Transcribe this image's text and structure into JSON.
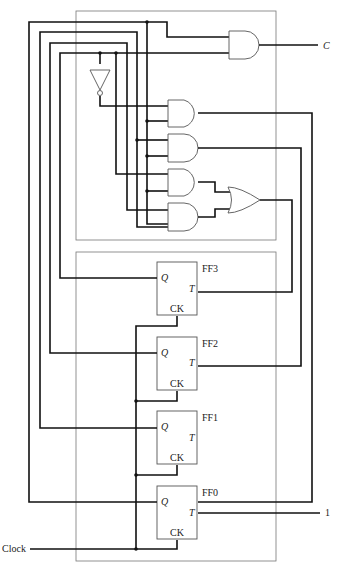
{
  "diagram": {
    "type": "logic-circuit",
    "outputs": {
      "carry_label": "C",
      "constant_input": "1"
    },
    "inputs": {
      "clock_label": "Clock"
    },
    "flip_flops": [
      {
        "name": "FF3",
        "q": "Q",
        "t": "T",
        "ck": "CK"
      },
      {
        "name": "FF2",
        "q": "Q",
        "t": "T",
        "ck": "CK"
      },
      {
        "name": "FF1",
        "q": "Q",
        "t": "T",
        "ck": "CK"
      },
      {
        "name": "FF0",
        "q": "Q",
        "t": "T",
        "ck": "CK"
      }
    ],
    "gates": [
      "AND (carry)",
      "NOT",
      "AND",
      "AND",
      "AND",
      "AND",
      "OR"
    ]
  }
}
